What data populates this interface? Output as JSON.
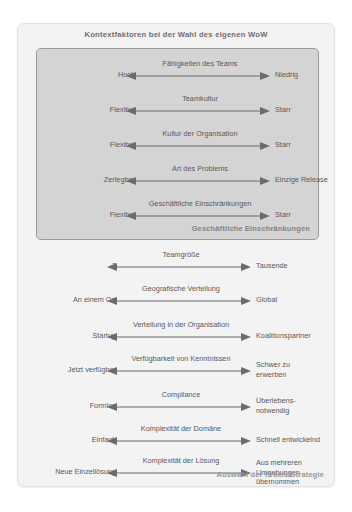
{
  "diagram": {
    "title": "Kontextfaktoren bei der Wahl des eigenen WoW",
    "inner_group_caption": "Geschäftliche Einschränkungen",
    "outer_group_caption": "Auswahl der Praxis/Strategie",
    "arrow_color": "#6a6b6e",
    "panel_background": "#f3f3f3",
    "inner_background": "#d4d4d4",
    "text_color": "#58595c"
  },
  "inner_factors": [
    {
      "name": "Fähigkeiten des Teams",
      "left": "Hoch",
      "right": "Niedrig"
    },
    {
      "name": "Teamkultur",
      "left": "Flexibel",
      "right": "Starr"
    },
    {
      "name": "Kultur der Organisation",
      "left": "Flexibel",
      "right": "Starr"
    },
    {
      "name": "Art des Problems",
      "left": "Zerlegbar",
      "right": "Einzige Release"
    },
    {
      "name": "Geschäftliche Einschränkungen",
      "left": "Flexibel",
      "right": "Starr"
    }
  ],
  "outer_factors": [
    {
      "name": "Teamgröße",
      "left": "2",
      "right": "Tausende"
    },
    {
      "name": "Geografische Verteilung",
      "left": "An einem Ort",
      "right": "Global"
    },
    {
      "name": "Verteilung in der Organisation",
      "left": "Startup",
      "right": "Koalitionspartner"
    },
    {
      "name": "Verfügbarkeit von Kenntnissen",
      "left": "Jetzt verfügbar",
      "right": "Schwer zu\nerwerben"
    },
    {
      "name": "Compliance",
      "left": "Formlos",
      "right": "Überlebens-\nnotwendig"
    },
    {
      "name": "Komplexität der Domäne",
      "left": "Einfach",
      "right": "Schnell entwickelnd"
    },
    {
      "name": "Komplexität der Lösung",
      "left": "Neue Einzellösung",
      "right": "Aus mehreren\nUmgebungen\nübernommen"
    }
  ]
}
